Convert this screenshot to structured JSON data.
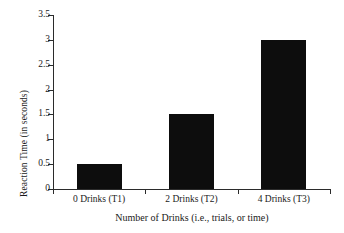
{
  "chart_data": {
    "type": "bar",
    "title": "",
    "subtitle": "",
    "xlabel": "Number of Drinks (i.e., trials, or time)",
    "ylabel": "Reaction Time (in seconds)",
    "categories": [
      "0 Drinks (T1)",
      "2 Drinks (T2)",
      "4 Drinks (T3)"
    ],
    "values": [
      0.5,
      1.5,
      3.0
    ],
    "ylim": [
      0,
      3.5
    ],
    "yticks": [
      0,
      0.5,
      1,
      1.5,
      2,
      2.5,
      3,
      3.5
    ],
    "ytick_labels": [
      "0",
      "0.5",
      "1",
      "1.5",
      "2",
      "2.5",
      "3",
      "3.5"
    ],
    "grid": false,
    "legend": null,
    "legend_position": "none",
    "bar_color": "#0d0d0d",
    "axis_color": "#2b2b2b",
    "background_color": "#ffffff"
  },
  "axes": {
    "y_title": "Reaction Time (in seconds)",
    "x_title": "Number of Drinks (i.e., trials, or time)"
  },
  "ticks": {
    "y": [
      {
        "label": "3.5",
        "value": 3.5
      },
      {
        "label": "3",
        "value": 3
      },
      {
        "label": "2.5",
        "value": 2.5
      },
      {
        "label": "2",
        "value": 2
      },
      {
        "label": "1.5",
        "value": 1.5
      },
      {
        "label": "1",
        "value": 1
      },
      {
        "label": "0.5",
        "value": 0.5
      },
      {
        "label": "0",
        "value": 0
      }
    ]
  },
  "bars": [
    {
      "label": "0 Drinks (T1)",
      "value": 0.5
    },
    {
      "label": "2 Drinks (T2)",
      "value": 1.5
    },
    {
      "label": "4 Drinks (T3)",
      "value": 3.0
    }
  ]
}
